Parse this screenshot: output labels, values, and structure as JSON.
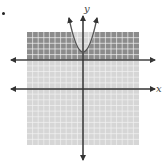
{
  "figure": {
    "bullet": "•",
    "x_axis_label": "x",
    "y_axis_label": "y",
    "grid": {
      "min": -10,
      "max": 10,
      "step": 1
    },
    "curves": [
      {
        "name": "parabola",
        "type": "parabola",
        "vertex": [
          0,
          7
        ],
        "opens": "up",
        "style": "solid"
      },
      {
        "name": "horizontal-line",
        "type": "line",
        "equation": "y = 5",
        "style": "solid"
      }
    ],
    "shading": {
      "dark_region": "above line y = 5 (outside parabola)",
      "light_region": "below line y = 5 and inside parabola"
    },
    "colors": {
      "dark_shade": "#8c8c8c",
      "light_shade": "#d6d6d6",
      "grid_line": "#f2f2f2",
      "axis": "#333333",
      "curve": "#555555"
    }
  }
}
